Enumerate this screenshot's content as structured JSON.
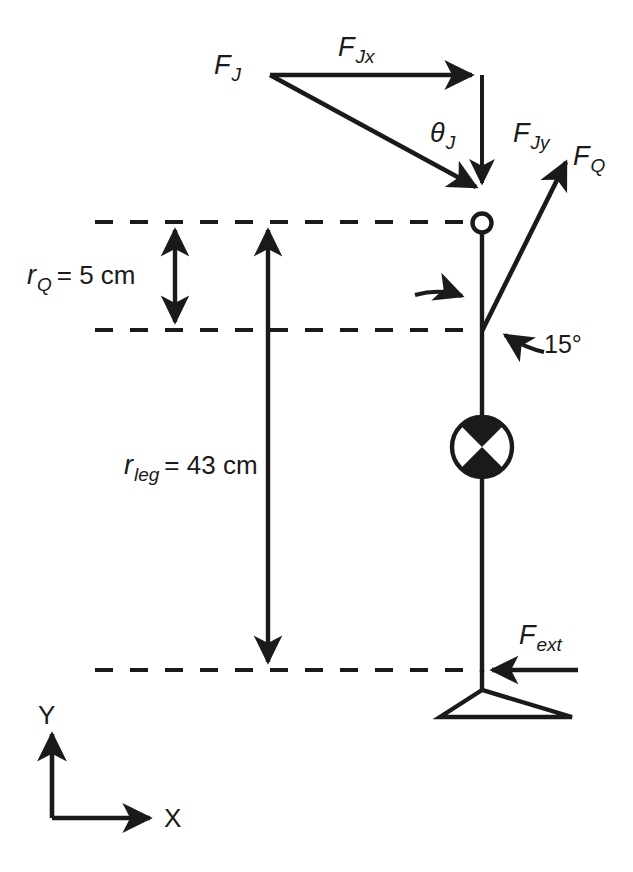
{
  "figure": {
    "type": "free-body-diagram",
    "background_color": "#ffffff",
    "stroke_color": "#1a1a1a"
  },
  "labels": {
    "force_joint": {
      "symbol": "F",
      "subscript": "J"
    },
    "force_joint_x": {
      "symbol": "F",
      "subscript": "Jx"
    },
    "force_joint_y": {
      "symbol": "F",
      "subscript": "Jy"
    },
    "force_quad": {
      "symbol": "F",
      "subscript": "Q"
    },
    "force_external": {
      "symbol": "F",
      "subscript": "ext"
    },
    "angle_joint": {
      "symbol": "θ",
      "subscript": "J"
    },
    "angle_quad": {
      "value": "15°"
    },
    "moment_arm_quad": {
      "symbol": "r",
      "subscript": "Q",
      "equals": "= 5 cm",
      "value": 5,
      "unit": "cm"
    },
    "moment_arm_leg": {
      "symbol": "r",
      "subscript": "leg",
      "equals": "= 43 cm",
      "value": 43,
      "unit": "cm"
    },
    "axis_x": "X",
    "axis_y": "Y"
  },
  "annotations": {
    "quad_insertion_pointer": "curved-leader-arrow",
    "quad_angle_pointer": "curved-leader-arrow",
    "center_of_mass": "com-symbol-circle-quadrants"
  }
}
